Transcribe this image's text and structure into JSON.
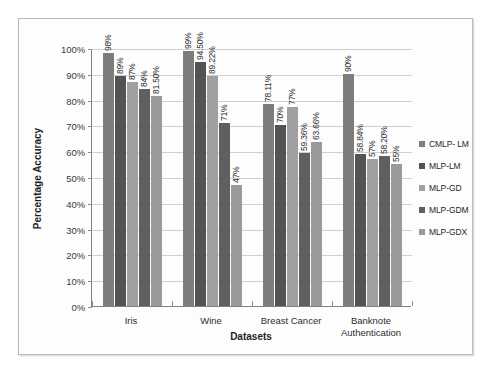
{
  "chart_data": {
    "type": "bar",
    "title": "",
    "xlabel": "Datasets",
    "ylabel": "Percentage Accuracy",
    "ylim": [
      0,
      100
    ],
    "ytick_labels": [
      "100%",
      "90%",
      "80%",
      "70%",
      "60%",
      "50%",
      "40%",
      "30%",
      "20%",
      "10%",
      "0%"
    ],
    "ytick_values": [
      100,
      90,
      80,
      70,
      60,
      50,
      40,
      30,
      20,
      10,
      0
    ],
    "grid": true,
    "legend_position": "right",
    "categories": [
      "Iris",
      "Wine",
      "Breast Cancer",
      "Banknote\nAuthentication"
    ],
    "series": [
      {
        "name": "CMLP- LM",
        "color": "#7d7d7d",
        "values": [
          98,
          99,
          78.11,
          90
        ],
        "labels": [
          "98%",
          "99%",
          "78.11%",
          "90%"
        ]
      },
      {
        "name": "MLP-LM",
        "color": "#535353",
        "values": [
          89,
          94.5,
          70,
          58.84
        ],
        "labels": [
          "89%",
          "94.50%",
          "70%",
          "58.84%"
        ]
      },
      {
        "name": "MLP-GD",
        "color": "#a0a0a0",
        "values": [
          87,
          89.22,
          77,
          57
        ],
        "labels": [
          "87%",
          "89.22%",
          "77%",
          "57%"
        ]
      },
      {
        "name": "MLP-GDM",
        "color": "#5f5f5f",
        "values": [
          84,
          71,
          59.36,
          58.2
        ],
        "labels": [
          "84%",
          "71%",
          "59.36%",
          "58.20%"
        ]
      },
      {
        "name": "MLP-GDX",
        "color": "#9a9a9a",
        "values": [
          81.5,
          47,
          63.66,
          55
        ],
        "labels": [
          "81.50%",
          "47%",
          "63.66%",
          "55%"
        ]
      }
    ]
  }
}
